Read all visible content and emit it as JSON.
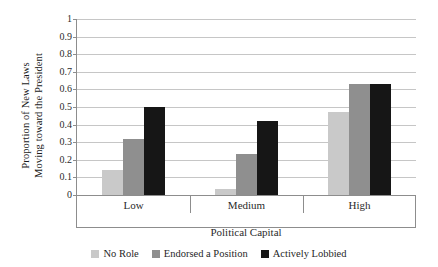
{
  "chart_data": {
    "type": "bar",
    "title": "",
    "subtitle": "",
    "xlabel": "Political Capital",
    "ylabel_lines": [
      "Proportion of New Laws",
      "Moving toward the President"
    ],
    "ylabel": "Proportion of New Laws Moving toward the President",
    "categories": [
      "Low",
      "Medium",
      "High"
    ],
    "series": [
      {
        "name": "No Role",
        "color": "#c9c9c9",
        "values": [
          0.14,
          0.035,
          0.47
        ]
      },
      {
        "name": "Endorsed a Position",
        "color": "#8f8f8f",
        "values": [
          0.32,
          0.235,
          0.63
        ]
      },
      {
        "name": "Actively Lobbied",
        "color": "#161616",
        "values": [
          0.5,
          0.42,
          0.63
        ]
      }
    ],
    "ylim": [
      0,
      1
    ],
    "ytick_values": [
      0,
      0.1,
      0.2,
      0.3,
      0.4,
      0.5,
      0.6,
      0.7,
      0.8,
      0.9,
      1
    ],
    "ytick_labels": [
      "0",
      "0.1",
      "0.2",
      "0.3",
      "0.4",
      "0.5",
      "0.6",
      "0.7",
      "0.8",
      "0.9",
      "1"
    ],
    "grid": true,
    "grid_axis": "y",
    "legend_position": "bottom",
    "background_color": "#ffffff",
    "grid_color": "#c6c6c6",
    "axis_color": "#8d8d8d"
  }
}
